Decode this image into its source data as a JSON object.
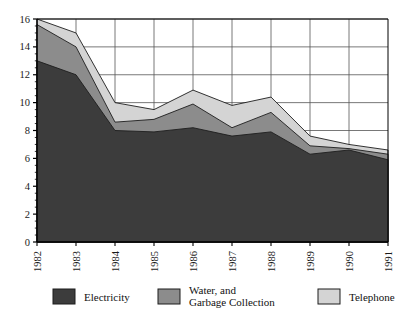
{
  "chart_data": {
    "type": "area",
    "stacked": true,
    "title": "",
    "subtitle": "",
    "xlabel": "",
    "ylabel": "",
    "categories": [
      "1982",
      "1983",
      "1984",
      "1985",
      "1986",
      "1987",
      "1988",
      "1989",
      "1990",
      "1991"
    ],
    "x": [
      1982,
      1983,
      1984,
      1985,
      1986,
      1987,
      1988,
      1989,
      1990,
      1991
    ],
    "series": [
      {
        "name": "Electricity",
        "color": "#3c3c3c",
        "values": [
          13.0,
          12.0,
          8.0,
          7.9,
          8.2,
          7.6,
          7.9,
          6.3,
          6.6,
          5.9
        ]
      },
      {
        "name": "Water, and Garbage Collection",
        "color": "#8c8c8c",
        "values": [
          2.6,
          2.0,
          0.6,
          0.9,
          1.7,
          0.6,
          1.4,
          0.6,
          0.1,
          0.4
        ]
      },
      {
        "name": "Telephone",
        "color": "#d4d4d4",
        "values": [
          0.4,
          1.0,
          1.4,
          0.7,
          1.0,
          1.6,
          1.1,
          0.7,
          0.3,
          0.3
        ]
      }
    ],
    "stack_totals": [
      16.0,
      15.0,
      10.0,
      9.5,
      10.9,
      9.8,
      10.4,
      7.6,
      7.0,
      6.6
    ],
    "ylim": [
      0,
      16
    ],
    "yticks": [
      0,
      2,
      4,
      6,
      8,
      10,
      12,
      14,
      16
    ],
    "ytick_labels": [
      "0",
      "2",
      "4",
      "6",
      "8",
      "10",
      "12",
      "14",
      "16"
    ],
    "xtick_labels": [
      "1982",
      "1983",
      "1984",
      "1985",
      "1986",
      "1987",
      "1988",
      "1989",
      "1990",
      "1991"
    ],
    "xtick_rotation": 90,
    "grid": true,
    "grid_color": "#555555",
    "legend_position": "bottom",
    "legend_entries": [
      {
        "label": "Electricity",
        "color": "#3c3c3c"
      },
      {
        "label_line1": "Water, and",
        "label_line2": "Garbage Collection",
        "color": "#8c8c8c"
      },
      {
        "label": "Telephone",
        "color": "#d4d4d4"
      }
    ],
    "plot_background": "#ffffff",
    "axis_color": "#000000"
  },
  "legend": {
    "electricity": "Electricity",
    "water_line1": "Water, and",
    "water_line2": "Garbage Collection",
    "telephone": "Telephone"
  }
}
